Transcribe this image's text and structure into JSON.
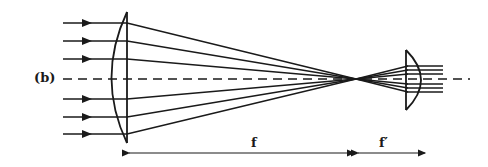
{
  "figure": {
    "panel_label": "(b)",
    "focal_length_label": "f",
    "focal_length_prime_label": "f′",
    "stroke_color": "#1a1a1a",
    "background": "#ffffff"
  },
  "geometry": {
    "axis_y": 79,
    "incoming_ray_ys": [
      23,
      41,
      59,
      99,
      117,
      134
    ],
    "lens1": {
      "flat_x": 127,
      "top": 12,
      "bottom": 143,
      "bulge_x": 108
    },
    "focal_point": {
      "x": 356,
      "y": 79
    },
    "lens2": {
      "flat_x": 406,
      "top": 50,
      "bottom": 110,
      "bulge_x": 422
    },
    "outgoing_ray_ys": [
      68,
      72,
      76,
      83,
      87,
      91
    ],
    "output_ray_end_x": 443,
    "dimension_y": 153
  }
}
